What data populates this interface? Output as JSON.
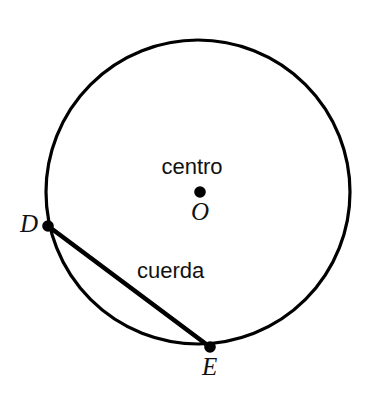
{
  "figure": {
    "type": "geometry-diagram",
    "language": "es",
    "background_color": "#ffffff",
    "stroke_color": "#000000"
  },
  "labels": {
    "center_word": "centro",
    "center_point": "O",
    "chord_word": "cuerda",
    "point_d": "D",
    "point_e": "E"
  },
  "geometry": {
    "circle": {
      "name": "circle-outline",
      "center_x": 198,
      "center_y": 192,
      "radius": 152,
      "stroke_width": 3.2,
      "stroke": "#000000",
      "fill": "none"
    },
    "points": [
      {
        "name": "center-point-o",
        "label": "O",
        "x": 200,
        "y": 192,
        "radius": 5.8,
        "fill": "#000000"
      },
      {
        "name": "point-d",
        "label": "D",
        "x": 48,
        "y": 226,
        "radius": 5.8,
        "fill": "#000000"
      },
      {
        "name": "point-e",
        "label": "E",
        "x": 210,
        "y": 347,
        "radius": 5.8,
        "fill": "#000000"
      }
    ],
    "chord": {
      "name": "chord-de",
      "from": "D",
      "to": "E",
      "x1": 48,
      "y1": 226,
      "x2": 210,
      "y2": 347,
      "stroke_width": 4.6,
      "stroke": "#000000"
    }
  }
}
